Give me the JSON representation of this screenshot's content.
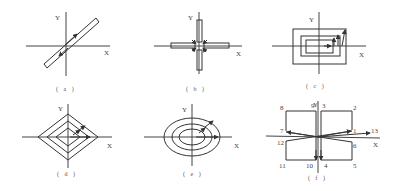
{
  "figure": {
    "panels": [
      {
        "id": "a",
        "caption": "( a )",
        "x_label": "X",
        "y_label": "Y",
        "shape": "diagonal-slot-loop"
      },
      {
        "id": "b",
        "caption": "( b )",
        "x_label": "X",
        "y_label": "Y",
        "shape": "cross-slots"
      },
      {
        "id": "c",
        "caption": "( c )",
        "x_label": "X",
        "y_label": "Y",
        "shape": "nested-rectangles"
      },
      {
        "id": "d",
        "caption": "( d )",
        "x_label": "X",
        "y_label": "Y",
        "shape": "nested-diamonds"
      },
      {
        "id": "e",
        "caption": "( e )",
        "x_label": "X",
        "y_label": "Y",
        "shape": "nested-ellipses"
      },
      {
        "id": "f",
        "caption": "( f )",
        "x_label": "X",
        "y_label": "Y",
        "shape": "bowtie-path",
        "points": [
          "1",
          "2",
          "3",
          "4",
          "5",
          "6",
          "7",
          "8",
          "9",
          "10",
          "11",
          "12",
          "13"
        ]
      }
    ]
  }
}
